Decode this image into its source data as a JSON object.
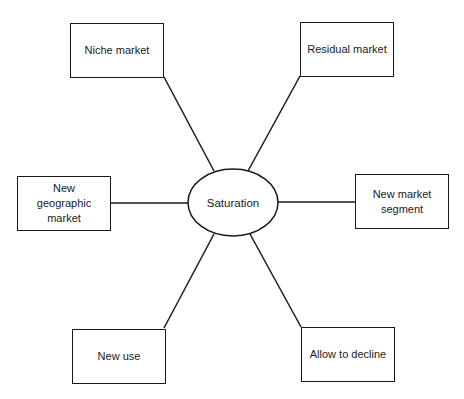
{
  "diagram": {
    "type": "hub-and-spoke",
    "center": {
      "label": "Saturation",
      "shape": "ellipse"
    },
    "nodes": [
      {
        "id": "niche",
        "label": "Niche market"
      },
      {
        "id": "residual",
        "label": "Residual market"
      },
      {
        "id": "geo",
        "label": "New geographic market"
      },
      {
        "id": "segment",
        "label": "New market segment"
      },
      {
        "id": "use",
        "label": "New use"
      },
      {
        "id": "decline",
        "label": "Allow to decline"
      }
    ],
    "edges": [
      {
        "from": "Saturation",
        "to": "Niche market"
      },
      {
        "from": "Saturation",
        "to": "Residual market"
      },
      {
        "from": "Saturation",
        "to": "New geographic market"
      },
      {
        "from": "Saturation",
        "to": "New market segment"
      },
      {
        "from": "Saturation",
        "to": "New use"
      },
      {
        "from": "Saturation",
        "to": "Allow to decline"
      }
    ],
    "colors": {
      "stroke": "#1a1a1a",
      "background": "#ffffff"
    }
  }
}
